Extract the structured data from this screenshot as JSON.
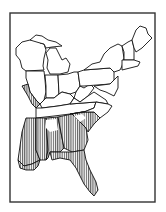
{
  "figure": {
    "type": "map",
    "frame": {
      "x": 10,
      "y": 13,
      "w": 145,
      "h": 189
    },
    "colors": {
      "ink": "#111111",
      "background": "#ffffff",
      "hatch": "#222222",
      "frame": "#333333"
    },
    "hatch": {
      "pattern": "vertical-lines",
      "spacing": 2.2,
      "stroke_width": 0.8
    },
    "legend": null,
    "labels": []
  },
  "regions": [
    {
      "id": "wisconsin",
      "hatched": false,
      "d": "M16,48 L22,42 L30,40 L36,38 L40,43 L44,44 L46,50 L44,58 L43,66 L44,70 L26,71 L22,68 L20,60 L16,55 Z"
    },
    {
      "id": "upper-michigan",
      "hatched": false,
      "d": "M30,40 L36,35 L42,36 L48,40 L56,42 L62,46 L52,47 L46,48 L44,44 L40,43 Z"
    },
    {
      "id": "lower-michigan",
      "hatched": false,
      "d": "M46,53 L50,48 L56,48 L60,56 L62,60 L66,58 L70,64 L68,72 L60,74 L50,74 L47,68 L48,60 Z"
    },
    {
      "id": "illinois",
      "hatched": false,
      "d": "M26,71 L44,71 L45,80 L46,92 L44,100 L40,104 L36,100 L30,92 L28,84 L26,78 Z"
    },
    {
      "id": "indiana",
      "hatched": false,
      "d": "M45,75 L58,75 L59,94 L54,98 L46,98 L46,86 Z"
    },
    {
      "id": "ohio",
      "hatched": false,
      "d": "M58,75 L68,74 L74,72 L78,72 L80,86 L76,92 L70,94 L62,92 L59,94 Z"
    },
    {
      "id": "kentucky",
      "hatched": false,
      "d": "M40,104 L46,98 L54,98 L59,94 L62,92 L70,94 L74,98 L70,104 L58,106 L42,108 Z"
    },
    {
      "id": "west-virginia",
      "hatched": false,
      "d": "M76,92 L80,86 L84,88 L90,84 L94,88 L88,96 L80,102 L74,98 Z"
    },
    {
      "id": "tennessee",
      "hatched": false,
      "d": "M36,108 L42,108 L58,106 L70,104 L96,102 L94,108 L84,112 L70,114 L54,116 L36,118 Z"
    },
    {
      "id": "virginia",
      "hatched": false,
      "d": "M70,104 L74,98 L80,102 L88,96 L94,92 L100,96 L106,100 L108,104 L96,102 Z"
    },
    {
      "id": "pennsylvania",
      "hatched": false,
      "d": "M78,72 L84,70 L110,68 L114,72 L114,80 L110,84 L84,86 L80,86 Z"
    },
    {
      "id": "new-york",
      "hatched": false,
      "d": "M84,70 L92,64 L100,62 L104,54 L110,48 L118,44 L122,46 L124,58 L122,66 L120,70 L114,72 L110,68 Z"
    },
    {
      "id": "maryland-delaware-nj",
      "hatched": false,
      "d": "M94,86 L110,84 L114,80 L118,76 L118,88 L114,96 L110,94 L106,92 L100,90 Z"
    },
    {
      "id": "vermont-nh",
      "hatched": false,
      "d": "M122,46 L128,42 L132,40 L134,48 L134,60 L124,60 L124,52 Z"
    },
    {
      "id": "maine",
      "hatched": false,
      "d": "M132,40 L136,30 L140,26 L146,28 L148,34 L152,38 L148,42 L142,48 L136,52 L134,48 Z"
    },
    {
      "id": "massachusetts-ct-ri",
      "hatched": false,
      "d": "M122,60 L134,60 L140,62 L138,66 L130,68 L122,70 Z"
    },
    {
      "id": "missouri-bootheel",
      "hatched": true,
      "d": "M22,86 L28,84 L30,92 L36,100 L40,104 L36,108 L32,104 L28,96 Z"
    },
    {
      "id": "arkansas-louisiana-strip",
      "hatched": true,
      "d": "M26,118 L36,118 L36,150 L40,160 L32,164 L24,166 L18,160 L20,146 L22,132 Z"
    },
    {
      "id": "mississippi",
      "hatched": true,
      "d": "M36,118 L46,118 L48,150 L46,160 L40,160 L36,150 Z"
    },
    {
      "id": "alabama",
      "hatched": true,
      "d": "M46,118 L58,117 L64,148 L60,152 L50,152 L48,158 L46,160 L48,150 Z"
    },
    {
      "id": "georgia",
      "hatched": true,
      "d": "M58,117 L72,114 L78,120 L86,128 L88,140 L84,150 L72,152 L64,148 Z"
    },
    {
      "id": "south-carolina",
      "hatched": true,
      "d": "M72,114 L82,112 L94,112 L100,118 L94,124 L88,132 L86,128 L78,120 Z"
    },
    {
      "id": "north-carolina",
      "hatched": false,
      "d": "M70,114 L84,112 L94,108 L96,102 L108,104 L112,106 L108,112 L100,118 L94,112 L82,112 Z"
    },
    {
      "id": "florida",
      "hatched": true,
      "d": "M50,152 L60,152 L72,152 L84,150 L86,160 L90,170 L96,182 L98,190 L94,196 L90,192 L84,184 L80,176 L76,168 L70,160 L60,158 L52,160 Z"
    },
    {
      "id": "louisiana-coast",
      "hatched": true,
      "d": "M18,160 L24,166 L32,164 L40,160 L38,166 L34,170 L26,170 L20,168 Z"
    }
  ],
  "unhatched_patches": [
    {
      "id": "alabama-north-gap",
      "d": "M46,120 L56,119 L58,130 L50,132 L46,128 Z"
    },
    {
      "id": "south-carolina-upland-gap",
      "d": "M74,116 L82,114 L86,118 L80,122 Z"
    }
  ]
}
